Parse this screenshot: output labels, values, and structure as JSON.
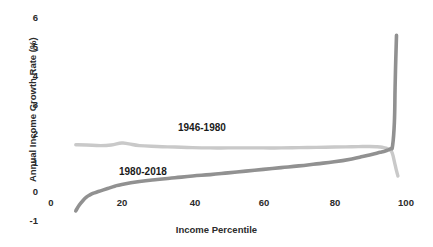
{
  "chart_data": {
    "type": "line",
    "title": "",
    "subtitle": "",
    "xlabel": "Income Percentile",
    "ylabel": "Annual Income Growth Rate (%)",
    "xlim": [
      0,
      100
    ],
    "ylim": [
      -1,
      6
    ],
    "xticks": [
      0,
      20,
      40,
      60,
      80,
      100
    ],
    "xtick_labels": [
      "0",
      "20",
      "40",
      "60",
      "80",
      "100"
    ],
    "yticks": [
      -1,
      0,
      1,
      2,
      3,
      4,
      5,
      6
    ],
    "ytick_labels": [
      "-1",
      "0",
      "1",
      "2",
      "3",
      "4",
      "5",
      "6"
    ],
    "grid": false,
    "legend_position": "inline-annotations",
    "series": [
      {
        "name": "1946-1980",
        "color": "#c9c9c9",
        "label_annotation": "1946-1980",
        "x": [
          7,
          10,
          14,
          17,
          20,
          22,
          25,
          30,
          35,
          40,
          45,
          50,
          55,
          60,
          65,
          70,
          75,
          80,
          85,
          88,
          90,
          92,
          93,
          94,
          95,
          96,
          96.5,
          97,
          97.5,
          98
        ],
        "y": [
          1.63,
          1.62,
          1.6,
          1.62,
          1.69,
          1.66,
          1.6,
          1.57,
          1.55,
          1.53,
          1.52,
          1.52,
          1.52,
          1.52,
          1.52,
          1.53,
          1.54,
          1.55,
          1.56,
          1.57,
          1.57,
          1.56,
          1.55,
          1.53,
          1.5,
          1.43,
          1.3,
          1.05,
          0.78,
          0.55
        ]
      },
      {
        "name": "1980-2018",
        "color": "#919191",
        "label_annotation": "1980-2018",
        "x": [
          7,
          8,
          9,
          10,
          11,
          12,
          13,
          14,
          16,
          18,
          20,
          25,
          30,
          35,
          40,
          45,
          50,
          55,
          60,
          65,
          70,
          75,
          80,
          85,
          88,
          90,
          92,
          93,
          94,
          95,
          96,
          96.5,
          97,
          97.2,
          97.4,
          97.6
        ],
        "y": [
          -0.65,
          -0.45,
          -0.3,
          -0.18,
          -0.1,
          -0.04,
          0.0,
          0.04,
          0.12,
          0.2,
          0.26,
          0.36,
          0.43,
          0.49,
          0.55,
          0.6,
          0.66,
          0.72,
          0.78,
          0.84,
          0.9,
          0.97,
          1.04,
          1.14,
          1.22,
          1.28,
          1.34,
          1.37,
          1.4,
          1.44,
          1.5,
          1.6,
          2.4,
          3.6,
          4.6,
          5.4
        ]
      }
    ],
    "annotations": [
      {
        "text": "1946-1980",
        "x": 34,
        "y": 2.1
      },
      {
        "text": "1980-2018",
        "x": 17,
        "y": 0.65
      }
    ]
  },
  "axis": {
    "x_title": "Income Percentile",
    "y_title": "Annual Income Growth Rate (%)",
    "x_tick_0": "0",
    "x_tick_20": "20",
    "x_tick_40": "40",
    "x_tick_60": "60",
    "x_tick_80": "80",
    "x_tick_100": "100",
    "y_tick_neg1": "-1",
    "y_tick_0": "0",
    "y_tick_1": "1",
    "y_tick_2": "2",
    "y_tick_3": "3",
    "y_tick_4": "4",
    "y_tick_5": "5",
    "y_tick_6": "6"
  },
  "labels": {
    "series_1": "1946-1980",
    "series_2": "1980-2018"
  },
  "colors": {
    "series_1": "#c9c9c9",
    "series_2": "#919191",
    "text": "#2b2b2b",
    "background": "#ffffff"
  }
}
